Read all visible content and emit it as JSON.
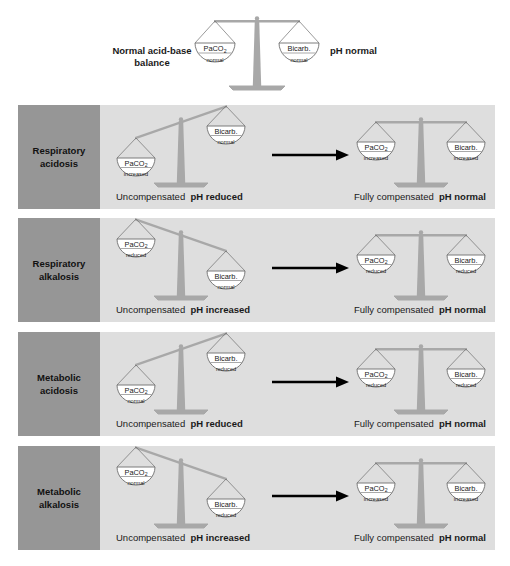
{
  "figure": {
    "title_text": "Acid-base balance scales diagram",
    "colors": {
      "page_background": "#ffffff",
      "row_background": "#dedede",
      "row_side_background": "#969696",
      "scale_gray": "#a8a8a8",
      "pan_outline": "#6e6e6e",
      "pan_fill": "#ffffff",
      "text": "#1a1a1a",
      "arrow": "#000000"
    }
  },
  "header": {
    "left_label": "Normal acid-base balance",
    "left_label_line1": "Normal acid-base",
    "left_label_line2": "balance",
    "right_label": "pH normal",
    "tilt": "balanced",
    "left_pan": {
      "main": "PaCO",
      "sub": "2",
      "state": "normal"
    },
    "right_pan": {
      "main": "Bicarb.",
      "state": "normal"
    }
  },
  "rows": [
    {
      "id": "respiratory-acidosis",
      "side_label_line1": "Respiratory",
      "side_label_line2": "acidosis",
      "uncompensated": {
        "tilt": "left-down",
        "left_pan": {
          "main": "PaCO",
          "sub": "2",
          "state": "increased"
        },
        "right_pan": {
          "main": "Bicarb.",
          "state": "normal"
        },
        "caption_normal": "Uncompensated",
        "caption_bold": "pH reduced"
      },
      "compensated": {
        "tilt": "balanced",
        "left_pan": {
          "main": "PaCO",
          "sub": "2",
          "state": "increased"
        },
        "right_pan": {
          "main": "Bicarb.",
          "state": "increased"
        },
        "caption_normal": "Fully compensated",
        "caption_bold": "pH normal"
      }
    },
    {
      "id": "respiratory-alkalosis",
      "side_label_line1": "Respiratory",
      "side_label_line2": "alkalosis",
      "uncompensated": {
        "tilt": "right-down",
        "left_pan": {
          "main": "PaCO",
          "sub": "2",
          "state": "reduced"
        },
        "right_pan": {
          "main": "Bicarb.",
          "state": "normal"
        },
        "caption_normal": "Uncompensated",
        "caption_bold": "pH increased"
      },
      "compensated": {
        "tilt": "balanced",
        "left_pan": {
          "main": "PaCO",
          "sub": "2",
          "state": "reduced"
        },
        "right_pan": {
          "main": "Bicarb.",
          "state": "reduced"
        },
        "caption_normal": "Fully compensated",
        "caption_bold": "pH normal"
      }
    },
    {
      "id": "metabolic-acidosis",
      "side_label_line1": "Metabolic",
      "side_label_line2": "acidosis",
      "uncompensated": {
        "tilt": "left-down",
        "left_pan": {
          "main": "PaCO",
          "sub": "2",
          "state": "normal"
        },
        "right_pan": {
          "main": "Bicarb.",
          "state": "reduced"
        },
        "caption_normal": "Uncompensated",
        "caption_bold": "pH reduced"
      },
      "compensated": {
        "tilt": "balanced",
        "left_pan": {
          "main": "PaCO",
          "sub": "2",
          "state": "reduced"
        },
        "right_pan": {
          "main": "Bicarb.",
          "state": "reduced"
        },
        "caption_normal": "Fully compensated",
        "caption_bold": "pH normal"
      }
    },
    {
      "id": "metabolic-alkalosis",
      "side_label_line1": "Metabolic",
      "side_label_line2": "alkalosis",
      "uncompensated": {
        "tilt": "right-down",
        "left_pan": {
          "main": "PaCO",
          "sub": "2",
          "state": "normal"
        },
        "right_pan": {
          "main": "Bicarb.",
          "state": "reduced"
        },
        "caption_normal": "Uncompensated",
        "caption_bold": "pH increased"
      },
      "compensated": {
        "tilt": "balanced",
        "left_pan": {
          "main": "PaCO",
          "sub": "2",
          "state": "increased"
        },
        "right_pan": {
          "main": "Bicarb.",
          "state": "increased"
        },
        "caption_normal": "Fully compensated",
        "caption_bold": "pH normal"
      }
    }
  ]
}
